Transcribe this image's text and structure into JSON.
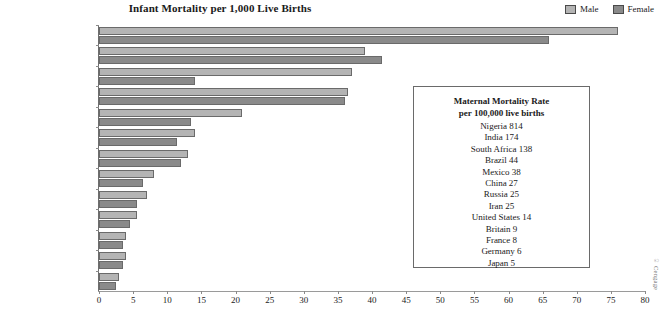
{
  "chart_data": {
    "type": "bar",
    "title": "Infant Mortality per 1,000 Live Births",
    "xlabel": "",
    "ylabel": "",
    "xlim": [
      0,
      80
    ],
    "xticks": [
      0,
      5,
      10,
      15,
      20,
      25,
      30,
      35,
      40,
      45,
      50,
      55,
      60,
      65,
      70,
      75,
      80
    ],
    "grid": false,
    "orientation": "horizontal",
    "legend_position": "top-right",
    "categories": [
      "Nigeria",
      "India",
      "Iran",
      "South Africa",
      "Brazil",
      "Mexico",
      "China",
      "Russia",
      "United States",
      "Britain",
      "Germany",
      "France",
      "Japan"
    ],
    "series": [
      {
        "name": "Male",
        "color": "#b4b4b4",
        "values": [
          76,
          39,
          37,
          36.5,
          21,
          14,
          13,
          8,
          7,
          5.5,
          4,
          4,
          3
        ]
      },
      {
        "name": "Female",
        "color": "#8a8a8a",
        "values": [
          66,
          41.5,
          14,
          36,
          13.5,
          11.5,
          12,
          6.5,
          5.5,
          4.5,
          3.5,
          3.5,
          2.5
        ]
      }
    ]
  },
  "legend": {
    "male_label": "Male",
    "female_label": "Female"
  },
  "inset": {
    "heading_line1": "Maternal Mortality Rate",
    "heading_line2": "per 100,000 live births",
    "rows": [
      "Nigeria 814",
      "India 174",
      "South Africa 138",
      "Brazil 44",
      "Mexico 38",
      "China 27",
      "Russia 25",
      "Iran 25",
      "United States 14",
      "Britain 9",
      "France 8",
      "Germany 6",
      "Japan 5"
    ]
  },
  "credit": "© Cengage"
}
